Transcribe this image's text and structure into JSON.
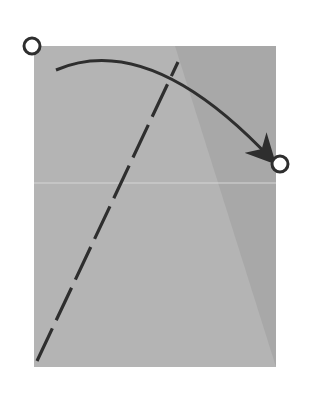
{
  "diagram": {
    "type": "origami-fold-step",
    "colors": {
      "background": "#ffffff",
      "paper": "#b4b4b4",
      "paper_shadow": "#a2a2a2",
      "crease": "#d6d6d6",
      "line": "#2e2e2e",
      "marker_fill": "#ffffff"
    },
    "paper": {
      "x": 34,
      "y": 46,
      "width": 242,
      "height": 321
    },
    "horizontal_crease": {
      "y": 183
    },
    "shadow_triangle": [
      [
        190,
        110
      ],
      [
        276,
        110
      ],
      [
        276,
        367
      ]
    ],
    "valley_fold_line": {
      "x1": 37,
      "y1": 361,
      "x2": 178,
      "y2": 62,
      "dash": "36 9"
    },
    "fold_arrow": {
      "start": [
        56,
        70
      ],
      "control": [
        150,
        30
      ],
      "end": [
        272,
        160
      ]
    },
    "markers": [
      {
        "name": "start-point",
        "cx": 32,
        "cy": 46,
        "r": 8
      },
      {
        "name": "target-point",
        "cx": 280,
        "cy": 164,
        "r": 8
      }
    ]
  }
}
